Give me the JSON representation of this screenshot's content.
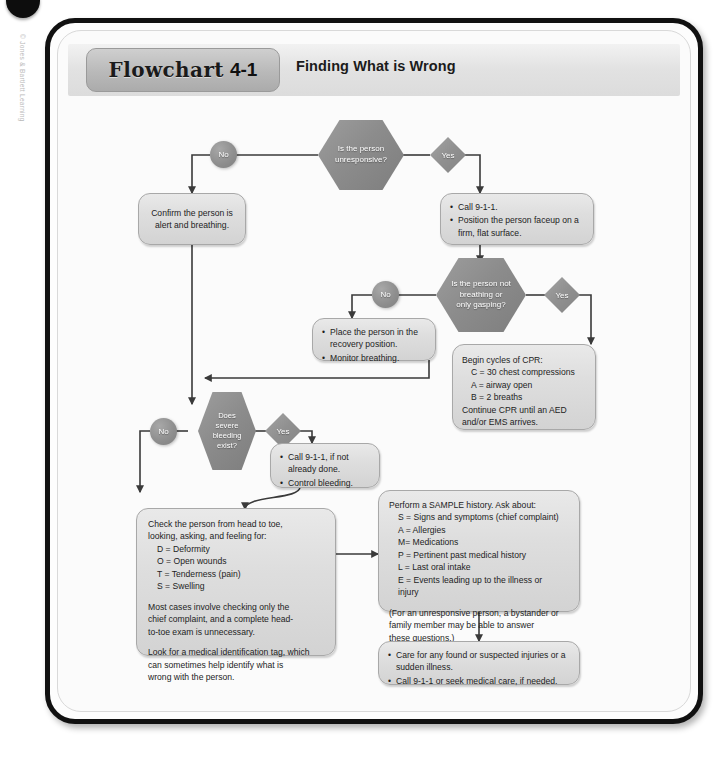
{
  "page": {
    "side_credit": "© Jones & Bartlett Learning"
  },
  "header": {
    "tab_word": "Flowchart",
    "tab_number": "4-1",
    "title": "Finding What is Wrong"
  },
  "decisions": [
    {
      "id": "d1",
      "text": "Is the person unresponsive?",
      "line1": "Is the person",
      "line2": "unresponsive?",
      "yes_label": "Yes",
      "no_label": "No"
    },
    {
      "id": "d2",
      "text": "Is the person not breathing or only gasping?",
      "line1": "Is the person not",
      "line2": "breathing or",
      "line3": "only gasping?",
      "yes_label": "Yes",
      "no_label": "No"
    },
    {
      "id": "d3",
      "text": "Does severe bleeding exist?",
      "line1": "Does",
      "line2": "severe",
      "line3": "bleeding",
      "line4": "exist?",
      "yes_label": "Yes",
      "no_label": "No"
    }
  ],
  "boxes": {
    "confirm_alert": {
      "line1": "Confirm the person is",
      "line2": "alert and breathing."
    },
    "call_position": {
      "bullets": [
        "Call 9-1-1.",
        "Position the person faceup on a firm, flat surface."
      ]
    },
    "recovery": {
      "bullets": [
        "Place the person in the recovery position.",
        "Monitor breathing."
      ]
    },
    "cpr": {
      "line1": "Begin cycles of CPR:",
      "line2": "C = 30 chest compressions",
      "line3": "A = airway open",
      "line4": "B = 2 breaths",
      "line5": "Continue CPR until an AED",
      "line6": "and/or EMS arrives."
    },
    "bleeding_care": {
      "bullets": [
        "Call 9-1-1, if not already done.",
        "Control bleeding."
      ]
    },
    "head_to_toe": {
      "line1": "Check the person from head to toe,",
      "line2": "looking, asking, and feeling for:",
      "line3": "D = Deformity",
      "line4": "O = Open wounds",
      "line5": "T = Tenderness (pain)",
      "line6": "S = Swelling",
      "line7": "Most cases involve checking only the",
      "line8": "chief complaint, and a complete head-",
      "line9": "to-toe exam is unnecessary.",
      "line10": "Look for a medical identification tag, which",
      "line11": "can sometimes help identify what is",
      "line12": "wrong with the person."
    },
    "sample_history": {
      "line1": "Perform a SAMPLE history. Ask about:",
      "line2": "S = Signs and symptoms (chief complaint)",
      "line3": "A = Allergies",
      "line4": "M= Medications",
      "line5": "P = Pertinent past medical history",
      "line6": "L = Last oral intake",
      "line7": "E = Events leading up to the illness or",
      "line8": "injury",
      "line9": "(For an unresponsive person, a bystander or",
      "line10": "family member may be able to answer",
      "line11": "these questions.)"
    },
    "final_care": {
      "bullets": [
        "Care for any found or suspected injuries or a sudden illness.",
        "Call 9-1-1 or seek medical care, if needed."
      ]
    }
  },
  "colors": {
    "decision_fill": "#8c8c8c",
    "box_fill": "#dedede",
    "box_border": "#a8a8a8",
    "connector": "#3a3a3a",
    "frame": "#111111",
    "header_band": "#e2e2e2",
    "tab_fill": "#b9b9b9"
  }
}
